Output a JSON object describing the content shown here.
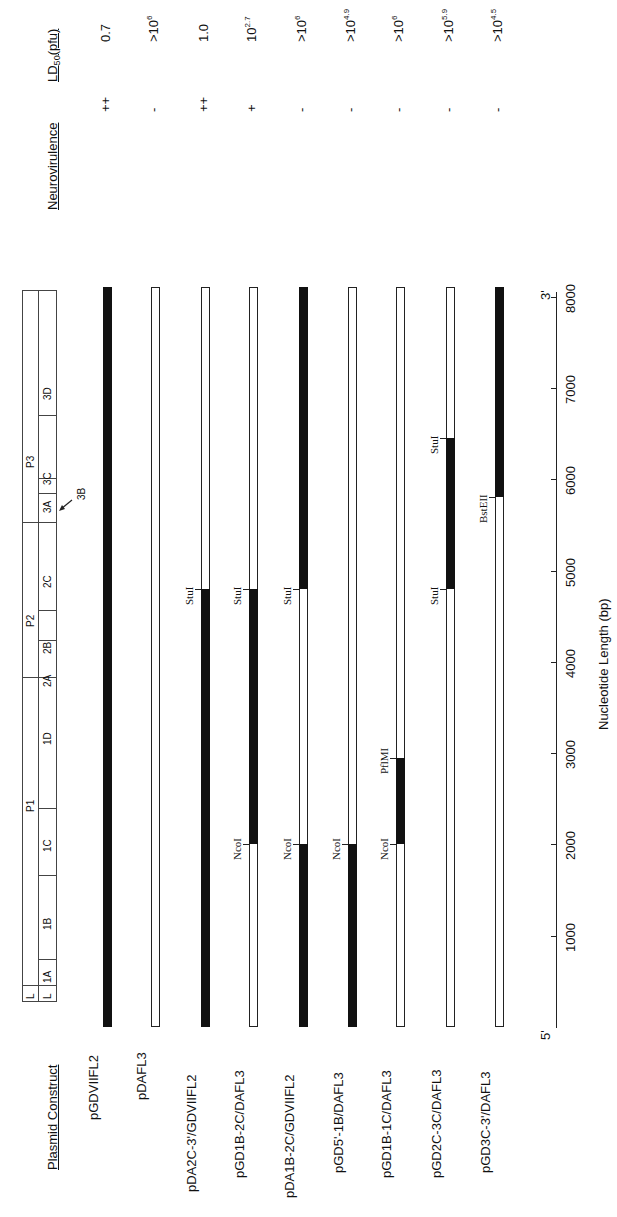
{
  "headers": {
    "plasmid_construct": "Plasmid  Construct",
    "neurovirulence": "Neurovirulence",
    "ld50_prefix": "LD",
    "ld50_sub": "50",
    "ld50_suffix": "(pfu)"
  },
  "axis": {
    "label": "Nucleotide Length (bp)",
    "five_prime": "5'",
    "three_prime": "3'",
    "ticks": [
      "1000",
      "2000",
      "3000",
      "4000",
      "5000",
      "6000",
      "7000",
      "8000"
    ]
  },
  "genome_map": {
    "top_row": [
      "L",
      "P1",
      "P2",
      "P3"
    ],
    "bottom_row": [
      "L",
      "1A",
      "1B",
      "1C",
      "1D",
      "2A",
      "2B",
      "2C",
      "3A",
      "3C",
      "3D"
    ],
    "pointer": "3B"
  },
  "constructs": [
    {
      "name": "pGDVIIFL2",
      "neuro": "++",
      "ld50": "0.7",
      "ld50_exp": ""
    },
    {
      "name": "pDAFL3",
      "neuro": "-",
      "ld50": ">10",
      "ld50_exp": "6"
    },
    {
      "name": "pDA2C-3'/GDVIIFL2",
      "neuro": "++",
      "ld50": "1.0",
      "ld50_exp": ""
    },
    {
      "name": "pGD1B-2C/DAFL3",
      "neuro": "+",
      "ld50": "10",
      "ld50_exp": "2.7"
    },
    {
      "name": "pDA1B-2C/GDVIIFL2",
      "neuro": "-",
      "ld50": ">10",
      "ld50_exp": "6"
    },
    {
      "name": "pGD5'-1B/DAFL3",
      "neuro": "-",
      "ld50": ">10",
      "ld50_exp": "4.9"
    },
    {
      "name": "pGD1B-1C/DAFL3",
      "neuro": "-",
      "ld50": ">10",
      "ld50_exp": "6"
    },
    {
      "name": "pGD2C-3C/DAFL3",
      "neuro": "-",
      "ld50": ">10",
      "ld50_exp": "5.9"
    },
    {
      "name": "pGD3C-3'/DAFL3",
      "neuro": "-",
      "ld50": ">10",
      "ld50_exp": "4.5"
    }
  ],
  "sites": {
    "stu1": "StuI",
    "nco1": "NcoI",
    "pflm1": "PflMI",
    "bsteii": "BstEII"
  },
  "chart_data": {
    "type": "table",
    "xlabel": "Nucleotide Length (bp)",
    "xlim": [
      0,
      8100
    ],
    "legend": {
      "filled": "GDVII sequence",
      "open": "DA sequence"
    },
    "columns": [
      "Plasmid Construct",
      "GDVII segment (bp)",
      "Neurovirulence",
      "LD50 (pfu)"
    ],
    "rows": [
      [
        "pGDVIIFL2",
        "0-8100",
        "++",
        "0.7"
      ],
      [
        "pDAFL3",
        "none",
        "-",
        ">10^6"
      ],
      [
        "pDA2C-3'/GDVIIFL2",
        "0-4800 (StuI)",
        "++",
        "1.0"
      ],
      [
        "pGD1B-2C/DAFL3",
        "2000 (NcoI)-4800 (StuI)",
        "+",
        "10^2.7"
      ],
      [
        "pDA1B-2C/GDVIIFL2",
        "0-2000 (NcoI), 4800 (StuI)-8100",
        "-",
        ">10^6"
      ],
      [
        "pGD5'-1B/DAFL3",
        "0-2000 (NcoI)",
        "-",
        ">10^4.9"
      ],
      [
        "pGD1B-1C/DAFL3",
        "2000 (NcoI)-2950 (PflMI)",
        "-",
        ">10^6"
      ],
      [
        "pGD2C-3C/DAFL3",
        "4800 (StuI)-6450 (StuI)",
        "-",
        ">10^5.9"
      ],
      [
        "pGD3C-3'/DAFL3",
        "5800 (BstEII)-8100",
        "-",
        ">10^4.5"
      ]
    ]
  }
}
